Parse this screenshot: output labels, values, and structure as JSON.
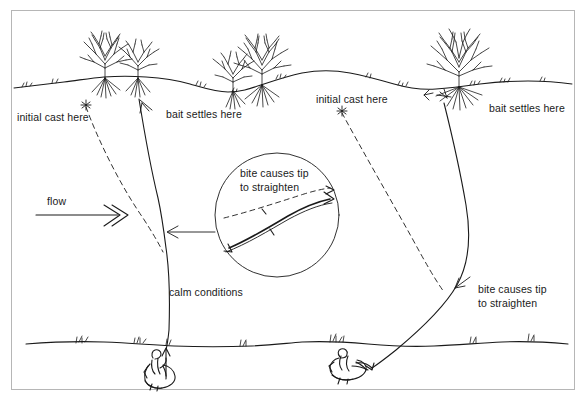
{
  "diagram": {
    "type": "hand-drawn-illustration",
    "background_color": "#ffffff",
    "ink_color": "#1a1a1a",
    "frame_color": "#b6b6b6"
  },
  "labels": {
    "flow": "flow",
    "initial_cast_left": "initial cast here",
    "bait_settles_left": "bait settles here",
    "initial_cast_right": "initial cast here",
    "bait_settles_right": "bait settles here",
    "calm_conditions": "calm conditions",
    "bite_straighten_right": [
      "bite causes tip",
      "to straighten"
    ],
    "inset_caption": [
      "bite causes tip",
      "to straighten"
    ]
  },
  "scenes": {
    "left": {
      "name": "flowing-water-scene",
      "condition": "flow",
      "cast_marker": "asterisk",
      "line_style_initial": "dashed",
      "line_style_settled": "solid",
      "angler": "seated-angler-left"
    },
    "right": {
      "name": "calm-water-scene",
      "condition": "calm",
      "cast_marker": "asterisk",
      "line_style_initial": "dashed",
      "line_style_settled": "solid",
      "angler": "reclined-angler-right"
    }
  },
  "inset": {
    "name": "rod-tip-detail",
    "shape": "circle",
    "contents": "two rod tips: dashed straightened tip above, solid bent tip below"
  },
  "vegetation": {
    "far_bank_trees": 5,
    "near_bank_grass_tufts": 8
  }
}
